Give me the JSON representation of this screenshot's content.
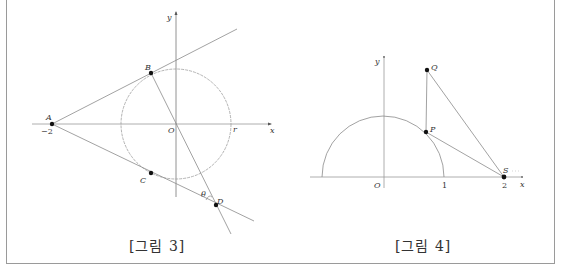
{
  "figures": [
    {
      "caption": "[그림 3]",
      "labels": {
        "y_axis": "y",
        "x_axis": "x",
        "origin": "O",
        "A": "A",
        "A_coord": "−2",
        "B": "B",
        "C": "C",
        "D": "D",
        "r": "r",
        "theta": "θ"
      },
      "elements": [
        "circle centered at O with radius r (dashed)",
        "tangent line AB",
        "tangent line AC extended to D",
        "line BOD"
      ]
    },
    {
      "caption": "[그림 4]",
      "labels": {
        "y_axis": "y",
        "x_axis": "x",
        "origin": "O",
        "tick_1": "1",
        "tick_2": "2",
        "P": "P",
        "Q": "Q",
        "S": "S"
      },
      "elements": [
        "upper semicircle radius 1",
        "segment PQ vertical",
        "segment PS",
        "segment QS"
      ]
    }
  ],
  "colors": {
    "line": "#8a8a8a",
    "point": "#111111",
    "frame": "#9a9a9a"
  }
}
